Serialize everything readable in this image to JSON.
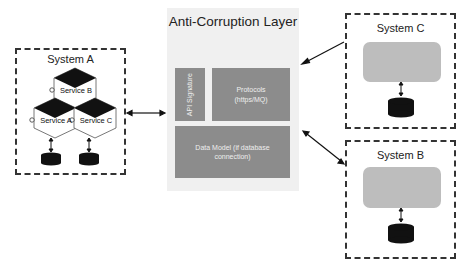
{
  "diagram": {
    "acl": {
      "title": "Anti-Corruption Layer",
      "components": {
        "api_signature": "API Signature",
        "protocols_line1": "Protocols",
        "protocols_line2": "(https/MQ)",
        "data_model_line1": "Data Model (if database",
        "data_model_line2": "connection)"
      },
      "fill_color": "#f0f0f0",
      "component_color": "#8c8c8c"
    },
    "system_a": {
      "title": "System A",
      "services": [
        "Service B",
        "Service A",
        "Service C"
      ],
      "databases": 2
    },
    "system_c": {
      "title": "System C",
      "databases": 1
    },
    "system_b": {
      "title": "System B",
      "databases": 1
    },
    "connections": [
      {
        "from": "System A",
        "to": "Anti-Corruption Layer",
        "type": "bidirectional"
      },
      {
        "from": "System C",
        "to": "Anti-Corruption Layer",
        "type": "directed"
      },
      {
        "from": "System B",
        "to": "Anti-Corruption Layer",
        "type": "bidirectional"
      }
    ]
  }
}
